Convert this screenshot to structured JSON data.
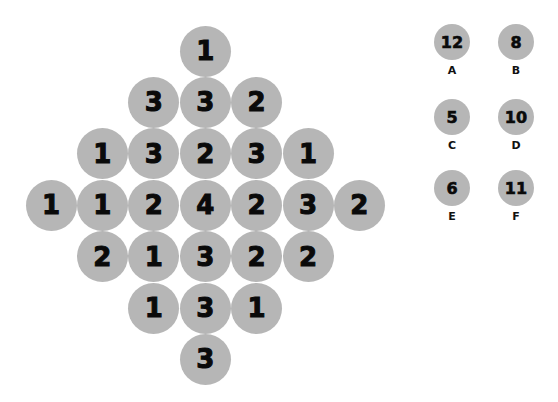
{
  "puzzle": {
    "grid": [
      {
        "row": 0,
        "col": 3,
        "value": "1"
      },
      {
        "row": 1,
        "col": 2,
        "value": "3"
      },
      {
        "row": 1,
        "col": 3,
        "value": "3"
      },
      {
        "row": 1,
        "col": 4,
        "value": "2"
      },
      {
        "row": 2,
        "col": 1,
        "value": "1"
      },
      {
        "row": 2,
        "col": 2,
        "value": "3"
      },
      {
        "row": 2,
        "col": 3,
        "value": "2"
      },
      {
        "row": 2,
        "col": 4,
        "value": "3"
      },
      {
        "row": 2,
        "col": 5,
        "value": "1"
      },
      {
        "row": 3,
        "col": 0,
        "value": "1"
      },
      {
        "row": 3,
        "col": 1,
        "value": "1"
      },
      {
        "row": 3,
        "col": 2,
        "value": "2"
      },
      {
        "row": 3,
        "col": 3,
        "value": "4"
      },
      {
        "row": 3,
        "col": 4,
        "value": "2"
      },
      {
        "row": 3,
        "col": 5,
        "value": "3"
      },
      {
        "row": 3,
        "col": 6,
        "value": "2"
      },
      {
        "row": 4,
        "col": 1,
        "value": "2"
      },
      {
        "row": 4,
        "col": 2,
        "value": "1"
      },
      {
        "row": 4,
        "col": 3,
        "value": "3"
      },
      {
        "row": 4,
        "col": 4,
        "value": "2"
      },
      {
        "row": 4,
        "col": 5,
        "value": "2"
      },
      {
        "row": 5,
        "col": 2,
        "value": "1"
      },
      {
        "row": 5,
        "col": 3,
        "value": "3"
      },
      {
        "row": 5,
        "col": 4,
        "value": "1"
      },
      {
        "row": 6,
        "col": 3,
        "value": "3"
      }
    ],
    "options": [
      {
        "label": "A",
        "value": "12"
      },
      {
        "label": "B",
        "value": "8"
      },
      {
        "label": "C",
        "value": "5"
      },
      {
        "label": "D",
        "value": "10"
      },
      {
        "label": "E",
        "value": "6"
      },
      {
        "label": "F",
        "value": "11"
      }
    ],
    "colors": {
      "circle_fill": "#b6b6b6",
      "digit": "#0a0a0a",
      "background": "#ffffff"
    }
  }
}
